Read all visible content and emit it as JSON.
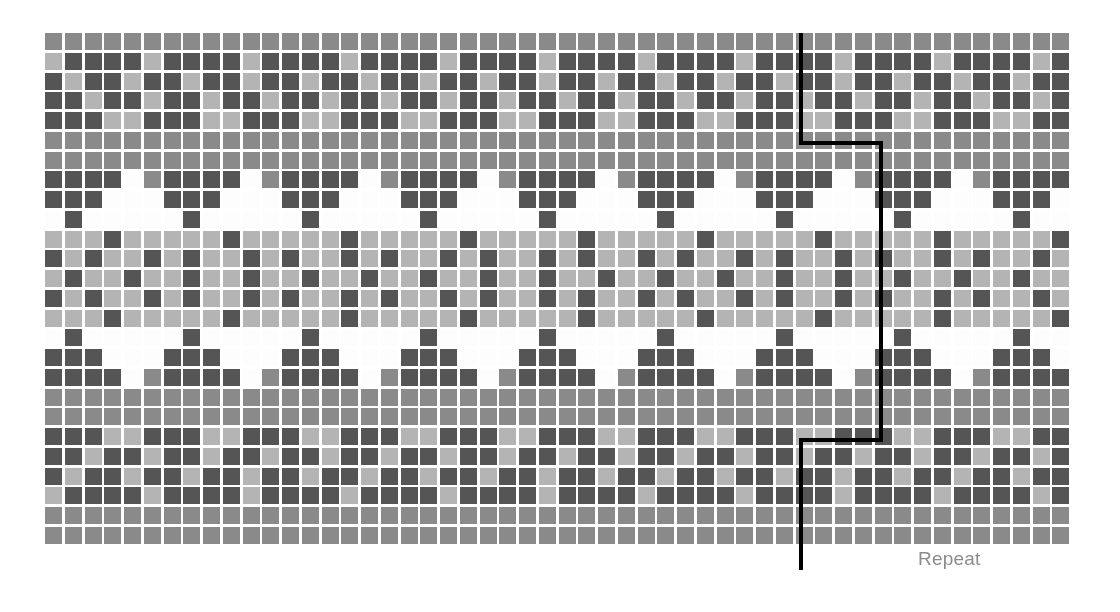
{
  "chart_data": {
    "type": "heatmap",
    "title": "",
    "subtitle": "",
    "xlabel": "",
    "ylabel": "",
    "grid": {
      "columns": 52,
      "rows": 26,
      "cell_size": 19.75,
      "cell_gap": 3,
      "origin_x": 45,
      "origin_y": 33
    },
    "legend_position": "none",
    "grid_on": false,
    "palette": {
      "M": "#8a8a8a",
      "L": "#b4b4b4",
      "D": "#555555",
      "W": "#fdfdfd"
    },
    "palette_names": {
      "M": "medium-grey",
      "L": "light-grey",
      "D": "dark-grey",
      "W": "white"
    },
    "motif_period": 6,
    "row_codes": [
      "MMMMMMMMMMMMMMMMMMMMMMMMMMMMMMMMMMMMMMMMMMMMMMMMMMMM",
      "LDDDDLDDDDLDDDDLDDDDLDDDDLDDDDLDDDDLDDDDLDDDDLDDDDLD",
      "DLDDLDDLDDLDDLDDLDDLDDLDDLDDLDDLDDLDDLDDLDDLDDLDDLDD",
      "DDLDDLDDLDDLDDLDDLDDLDDLDDLDDLDDLDDLDDLDDLDDLDDLDDLD",
      "DDDLLDDDLLDDDLLDDDLLDDDLLDDDLLDDDLLDDDLLDDDLLDDDLLDD",
      "MMMMMMMMMMMMMMMMMMMMMMMMMMMMMMMMMMMMMMMMMMMMMMMMMMMM",
      "MMMMMMMMMMMMMMMMMMMMMMMMMMMMMMMMMMMMMMMMMMMMMMMMMMMM",
      "DDDDWMDDDDWMDDDDWMDDDDWMDDDDWMDDDDWMDDDDWMDDDDWMDDDD",
      "DDDWWWDDDWWWDDDWWWDDDWWWDDDWWWDDDWWWDDDWWWDDDWWWDDDW",
      "WDWWWWWDWWWWWDWWWWWDWWWWWDWWWWWDWWWWWDWWWWWDWWWWWDWW",
      "LLLDLLLLLDLLLLLDLLLLLDLLLLLDLLLLLDLLLLLDLLLLLDLLLLLD",
      "DLDLLDLDLLDLDLLDLDLLDLDLLDLDLLDLDLLDLDLLDLDLLDLDLLDL",
      "LDLLDLLDLLDLLDLLDLLDLLDLLDLLDLLDLLDLLDLLDLLDLLDLLDLL",
      "DLDLLDLDLLDLDLLDLDLLDLDLLDLDLLDLDLLDLDLLDLDLLDLDLLDL",
      "LLLDLLLLLDLLLLLDLLLLLDLLLLLDLLLLLDLLLLLDLLLLLDLLLLLD",
      "WDWWWWWDWWWWWDWWWWWDWWWWWDWWWWWDWWWWWDWWWWWDWWWWWDWW",
      "DDDWWWDDDWWWDDDWWWDDDWWWDDDWWWDDDWWWDDDWWWDDDWWWDDDW",
      "DDDDWMDDDDWMDDDDWMDDDDWMDDDDWMDDDDWMDDDDWMDDDDWMDDDD",
      "MMMMMMMMMMMMMMMMMMMMMMMMMMMMMMMMMMMMMMMMMMMMMMMMMMMM",
      "MMMMMMMMMMMMMMMMMMMMMMMMMMMMMMMMMMMMMMMMMMMMMMMMMMMM",
      "DDDLLDDDLLDDDLLDDDLLDDDLLDDDLLDDDLLDDDLLDDDLLDDDLLDD",
      "DDLDDLDDLDDLDDLDDLDDLDDLDDLDDLDDLDDLDDLDDLDDLDDLDDLD",
      "DLDDLDDLDDLDDLDDLDDLDDLDDLDDLDDLDDLDDLDDLDDLDDLDDLDD",
      "LDDDDLDDDDLDDDDLDDDDLDDDDLDDDDLDDDDLDDDDLDDDDLDDDDLD",
      "MMMMMMMMMMMMMMMMMMMMMMMMMMMMMMMMMMMMMMMMMMMMMMMMMMMM",
      "MMMMMMMMMMMMMMMMMMMMMMMMMMMMMMMMMMMMMMMMMMMMMMMMMMMM"
    ]
  },
  "repeat_marker": {
    "label": "Repeat",
    "label_color": "#8c8c8c",
    "label_x": 918,
    "label_y": 549,
    "line_color": "#000000",
    "line_width": 4,
    "points": [
      [
        801,
        33
      ],
      [
        801,
        143
      ],
      [
        881,
        143
      ],
      [
        881,
        440
      ],
      [
        801,
        440
      ],
      [
        801,
        570
      ]
    ]
  },
  "canvas": {
    "width": 1120,
    "height": 612,
    "background": "#ffffff"
  }
}
